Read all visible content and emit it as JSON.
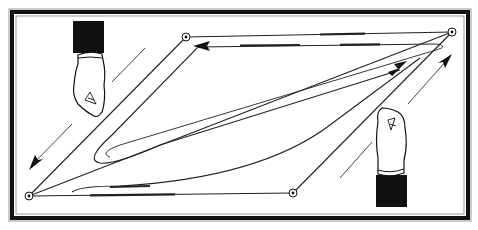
{
  "diagram": {
    "kind": "line-drawing",
    "colors": {
      "ink": "#111111",
      "paper": "#ffffff",
      "frame": "#1a1a1a",
      "frame_inner": "#9a9a9a"
    },
    "points": [
      {
        "id": "top-left",
        "x": 186,
        "y": 37
      },
      {
        "id": "top-right",
        "x": 452,
        "y": 32
      },
      {
        "id": "bottom-right",
        "x": 293,
        "y": 193
      },
      {
        "id": "bottom-left",
        "x": 29,
        "y": 196
      }
    ],
    "arrows": [
      {
        "id": "top-arrow",
        "direction": "left"
      },
      {
        "id": "loop-arrow",
        "direction": "up-right"
      },
      {
        "id": "left-guide-arrow",
        "direction": "down-left"
      },
      {
        "id": "right-guide-arrow",
        "direction": "up-right"
      }
    ],
    "figures": [
      {
        "id": "left-hand",
        "description": "hand with dark sleeve holding top-left edge, pointing down"
      },
      {
        "id": "right-hand",
        "description": "hand with dark sleeve holding bottom-right edge, pointing up"
      }
    ]
  }
}
